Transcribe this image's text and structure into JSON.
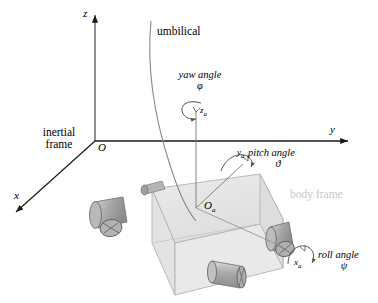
{
  "figure": {
    "type": "technical-diagram",
    "background_color": "#ffffff",
    "width": 378,
    "height": 303
  },
  "inertial_frame": {
    "label": "inertial\nframe",
    "label_line1": "inertial",
    "label_line2": "frame",
    "origin_label": "O",
    "axes": [
      {
        "name": "z-axis",
        "label": "z",
        "direction": "up"
      },
      {
        "name": "y-axis",
        "label": "y",
        "direction": "right"
      },
      {
        "name": "x-axis",
        "label": "x",
        "direction": "down-left"
      }
    ]
  },
  "body_frame": {
    "label": "body frame",
    "label_color": "#c9c9c9",
    "origin_label": "O",
    "origin_sub": "a",
    "axes": [
      {
        "name": "za-axis",
        "label": "z",
        "sub": "a"
      },
      {
        "name": "ya-axis",
        "label": "y",
        "sub": "a"
      },
      {
        "name": "xa-axis",
        "label": "x",
        "sub": "a"
      }
    ]
  },
  "angles": {
    "yaw": {
      "name": "yaw angle",
      "symbol": "φ",
      "axis_label": "z",
      "axis_sub": "a"
    },
    "pitch": {
      "name": "pitch angle",
      "symbol": "ϑ",
      "axis_label": "y",
      "axis_sub": "a"
    },
    "roll": {
      "name": "roll angle",
      "symbol": "ψ",
      "axis_label": "x",
      "axis_sub": "a"
    }
  },
  "umbilical": {
    "label": "umbilical"
  },
  "vehicle": {
    "name": "rov-body",
    "fill": "#e8e8e8",
    "stroke": "#9a9a9a",
    "thrusters": [
      {
        "name": "thruster-front-left"
      },
      {
        "name": "thruster-rear-left"
      },
      {
        "name": "thruster-front-right"
      },
      {
        "name": "thruster-rear-right"
      }
    ]
  }
}
